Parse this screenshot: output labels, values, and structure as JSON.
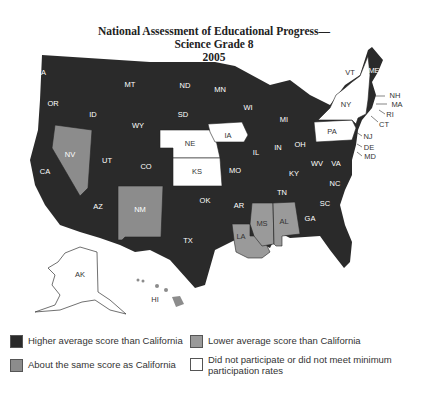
{
  "title": {
    "line1": "National Assessment of Educational Progress—",
    "line2": "Science Grade 8",
    "line3": "2005"
  },
  "colors": {
    "higher": "#2a2a2a",
    "same": "#8c8c8c",
    "lower": "#9a9a9a",
    "not_participating": "#ffffff"
  },
  "states": {
    "WA": "WA",
    "OR": "OR",
    "CA": "CA",
    "NV": "NV",
    "ID": "ID",
    "MT": "MT",
    "WY": "WY",
    "UT": "UT",
    "CO": "CO",
    "AZ": "AZ",
    "NM": "NM",
    "ND": "ND",
    "SD": "SD",
    "NE": "NE",
    "KS": "KS",
    "OK": "OK",
    "TX": "TX",
    "MN": "MN",
    "IA": "IA",
    "MO": "MO",
    "AR": "AR",
    "LA": "LA",
    "WI": "WI",
    "IL": "IL",
    "MS": "MS",
    "MI": "MI",
    "IN": "IN",
    "KY": "KY",
    "TN": "TN",
    "AL": "AL",
    "OH": "OH",
    "GA": "GA",
    "FL": "FL",
    "SC": "SC",
    "NC": "NC",
    "VA": "VA",
    "WV": "WV",
    "PA": "PA",
    "NY": "NY",
    "VT": "VT",
    "ME": "ME",
    "NH": "NH",
    "MA": "MA",
    "RI": "RI",
    "CT": "CT",
    "NJ": "NJ",
    "DE": "DE",
    "MD": "MD",
    "AK": "AK",
    "HI": "HI"
  },
  "legend": [
    {
      "key": "higher",
      "label": "Higher average score than California"
    },
    {
      "key": "lower",
      "label": "Lower average score than California"
    },
    {
      "key": "same",
      "label": "About the same score as California"
    },
    {
      "key": "not_participating",
      "label": "Did not participate or did not meet minimum participation rates"
    }
  ]
}
